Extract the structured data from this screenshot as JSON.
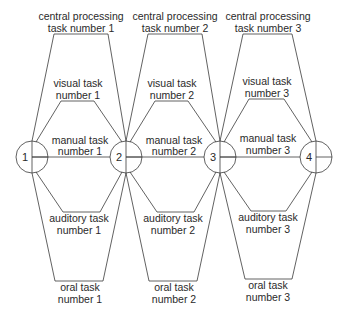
{
  "diagram": {
    "type": "network",
    "nodes": [
      {
        "id": "1",
        "label": "1",
        "cx": 32,
        "cy": 157
      },
      {
        "id": "2",
        "label": "2",
        "cx": 126,
        "cy": 157
      },
      {
        "id": "3",
        "label": "3",
        "cx": 220,
        "cy": 157
      },
      {
        "id": "4",
        "label": "4",
        "cx": 316,
        "cy": 157
      }
    ],
    "stages": [
      {
        "central": {
          "line1": "central processing",
          "line2": "task number 1"
        },
        "visual": {
          "line1": "visual task",
          "line2": "number 1"
        },
        "manual": {
          "line1": "manual task",
          "line2": "number 1"
        },
        "auditory": {
          "line1": "auditory task",
          "line2": "number 1"
        },
        "oral": {
          "line1": "oral task",
          "line2": "number 1"
        }
      },
      {
        "central": {
          "line1": "central processing",
          "line2": "task number 2"
        },
        "visual": {
          "line1": "visual task",
          "line2": "number 2"
        },
        "manual": {
          "line1": "manual task",
          "line2": "number 2"
        },
        "auditory": {
          "line1": "auditory task",
          "line2": "number 2"
        },
        "oral": {
          "line1": "oral task",
          "line2": "number 2"
        }
      },
      {
        "central": {
          "line1": "central processing",
          "line2": "task number 3"
        },
        "visual": {
          "line1": "visual task",
          "line2": "number 3"
        },
        "manual": {
          "line1": "manual task",
          "line2": "number 3"
        },
        "auditory": {
          "line1": "auditory task",
          "line2": "number 3"
        },
        "oral": {
          "line1": "oral task",
          "line2": "number 3"
        }
      }
    ]
  }
}
